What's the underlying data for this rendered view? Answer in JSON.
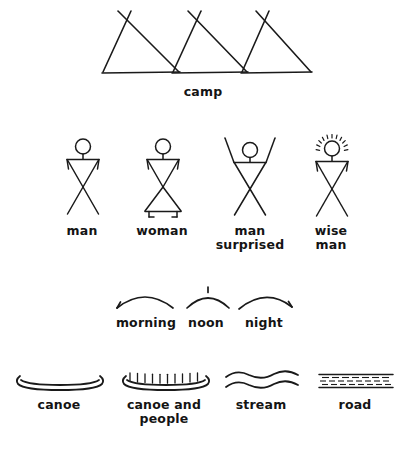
{
  "page": {
    "background_color": "#ffffff",
    "ink_color": "#1a1a1a",
    "width": 406,
    "height": 452
  },
  "rows": [
    {
      "id": "row-camp",
      "name": "camp-row",
      "labels": [
        {
          "id": "camp",
          "text": "camp",
          "x": 203,
          "y": 85
        }
      ],
      "glyphs": [
        {
          "id": "teepee-1",
          "name": "teepee-icon",
          "x": 95,
          "y": 4
        },
        {
          "id": "teepee-2",
          "name": "teepee-icon",
          "x": 168,
          "y": 4
        },
        {
          "id": "teepee-3",
          "name": "teepee-icon",
          "x": 238,
          "y": 4
        }
      ]
    },
    {
      "id": "row-people",
      "name": "people-row",
      "labels": [
        {
          "id": "man",
          "text": "man",
          "x": 82,
          "y": 224
        },
        {
          "id": "woman",
          "text": "woman",
          "x": 162,
          "y": 224
        },
        {
          "id": "man-surprised",
          "text": "man\nsurprised",
          "x": 250,
          "y": 224
        },
        {
          "id": "wise-man",
          "text": "wise\nman",
          "x": 331,
          "y": 224
        }
      ],
      "glyphs": [
        {
          "id": "figure-man",
          "name": "stick-figure-man-icon",
          "x": 57,
          "y": 136
        },
        {
          "id": "figure-woman",
          "name": "stick-figure-woman-icon",
          "x": 137,
          "y": 136
        },
        {
          "id": "figure-man-surprised",
          "name": "stick-figure-man-surprised-icon",
          "x": 222,
          "y": 136
        },
        {
          "id": "figure-wise-man",
          "name": "stick-figure-wise-man-icon",
          "x": 306,
          "y": 132
        }
      ]
    },
    {
      "id": "row-time",
      "name": "time-of-day-row",
      "labels": [
        {
          "id": "morning",
          "text": "morning",
          "x": 146,
          "y": 316
        },
        {
          "id": "noon",
          "text": "noon",
          "x": 206,
          "y": 316
        },
        {
          "id": "night",
          "text": "night",
          "x": 264,
          "y": 316
        }
      ],
      "glyphs": [
        {
          "id": "arc-morning",
          "name": "morning-arc-icon",
          "x": 113,
          "y": 288
        },
        {
          "id": "arc-noon",
          "name": "noon-arc-icon",
          "x": 183,
          "y": 286
        },
        {
          "id": "arc-night",
          "name": "night-arc-icon",
          "x": 236,
          "y": 288
        }
      ]
    },
    {
      "id": "row-travel",
      "name": "travel-row",
      "labels": [
        {
          "id": "canoe",
          "text": "canoe",
          "x": 59,
          "y": 398
        },
        {
          "id": "canoe-and-people",
          "text": "canoe and\npeople",
          "x": 164,
          "y": 398
        },
        {
          "id": "stream",
          "text": "stream",
          "x": 261,
          "y": 398
        },
        {
          "id": "road",
          "text": "road",
          "x": 355,
          "y": 398
        }
      ],
      "glyphs": [
        {
          "id": "icon-canoe",
          "name": "canoe-icon",
          "x": 14,
          "y": 374
        },
        {
          "id": "icon-canoe-and-people",
          "name": "canoe-with-people-icon",
          "x": 120,
          "y": 370
        },
        {
          "id": "icon-stream",
          "name": "stream-icon",
          "x": 224,
          "y": 370
        },
        {
          "id": "icon-road",
          "name": "road-icon",
          "x": 318,
          "y": 372
        }
      ]
    }
  ]
}
